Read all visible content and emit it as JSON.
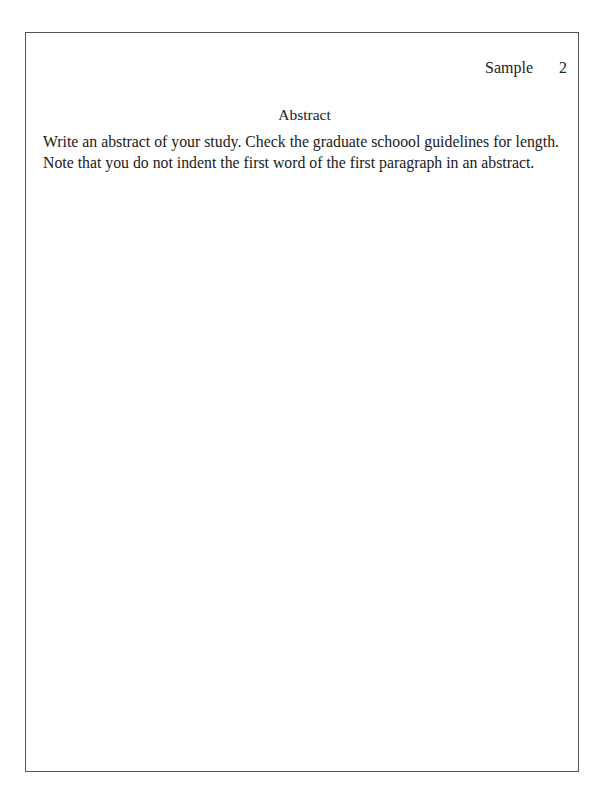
{
  "header": {
    "running_head": "Sample",
    "page_number": "2"
  },
  "section": {
    "title": "Abstract"
  },
  "body": {
    "lines": [
      "Write an abstract of your study. Check the graduate schoool guidelines for length.",
      "Note that you do not indent the first word of the first paragraph in an abstract."
    ]
  }
}
